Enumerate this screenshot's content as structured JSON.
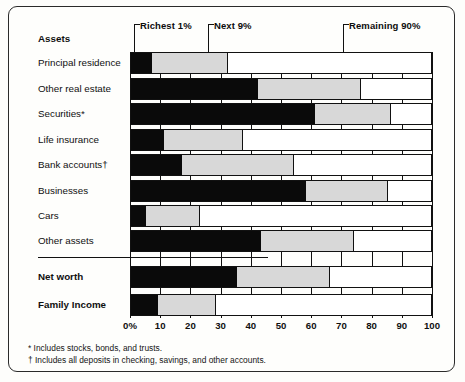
{
  "chart_data": {
    "type": "bar",
    "subtype": "stacked-horizontal-100pct",
    "title": "",
    "xlabel": "",
    "ylabel": "",
    "xlim": [
      0,
      100
    ],
    "grid": true,
    "legend_position": "top-callouts",
    "section_headers": [
      "Assets"
    ],
    "legend": [
      "Richest 1%",
      "Next 9%",
      "Remaining 90%"
    ],
    "colors": {
      "richest_1": "#0a0a0a",
      "next_9": "#d8d8d8",
      "remaining_90": "#ffffff",
      "outline": "#111111"
    },
    "categories": [
      "Principal residence",
      "Other real estate",
      "Securities*",
      "Life insurance",
      "Bank accounts†",
      "Businesses",
      "Cars",
      "Other assets",
      "Net worth",
      "Family Income"
    ],
    "series": [
      {
        "name": "Richest 1%",
        "values": [
          7,
          42,
          61,
          11,
          17,
          58,
          5,
          43,
          35,
          9
        ]
      },
      {
        "name": "Next 9%",
        "values": [
          25,
          34,
          25,
          26,
          37,
          27,
          18,
          31,
          31,
          19
        ]
      },
      {
        "name": "Remaining 90%",
        "values": [
          68,
          24,
          14,
          63,
          46,
          15,
          77,
          26,
          34,
          72
        ]
      }
    ],
    "xticks": [
      "0%",
      "10",
      "20",
      "30",
      "40",
      "50",
      "60",
      "70",
      "80",
      "90",
      "100"
    ],
    "xtick_values": [
      0,
      10,
      20,
      30,
      40,
      50,
      60,
      70,
      80,
      90,
      100
    ]
  },
  "header": {
    "section_label": "Assets",
    "callouts": [
      {
        "label": "Richest 1%",
        "x_pct": 1.5
      },
      {
        "label": "Next 9%",
        "x_pct": 26
      },
      {
        "label": "Remaining 90%",
        "x_pct": 71
      }
    ]
  },
  "rows": [
    {
      "label": "Principal residence",
      "bold": false,
      "s1": 7,
      "s2": 25
    },
    {
      "label": "Other real estate",
      "bold": false,
      "s1": 42,
      "s2": 34
    },
    {
      "label": "Securities*",
      "bold": false,
      "s1": 61,
      "s2": 25
    },
    {
      "label": "Life insurance",
      "bold": false,
      "s1": 11,
      "s2": 26
    },
    {
      "label": "Bank accounts†",
      "bold": false,
      "s1": 17,
      "s2": 37
    },
    {
      "label": "Businesses",
      "bold": false,
      "s1": 58,
      "s2": 27
    },
    {
      "label": "Cars",
      "bold": false,
      "s1": 5,
      "s2": 18
    },
    {
      "label": "Other assets",
      "bold": false,
      "s1": 43,
      "s2": 31
    },
    {
      "label": "Net worth",
      "bold": true,
      "s1": 35,
      "s2": 31
    },
    {
      "label": "Family Income",
      "bold": true,
      "s1": 9,
      "s2": 19
    }
  ],
  "axis": {
    "ticks": [
      "0%",
      "10",
      "20",
      "30",
      "40",
      "50",
      "60",
      "70",
      "80",
      "90",
      "100"
    ]
  },
  "footnotes": [
    "* Includes stocks, bonds, and trusts.",
    "† Includes all deposits in checking, savings, and other accounts."
  ]
}
